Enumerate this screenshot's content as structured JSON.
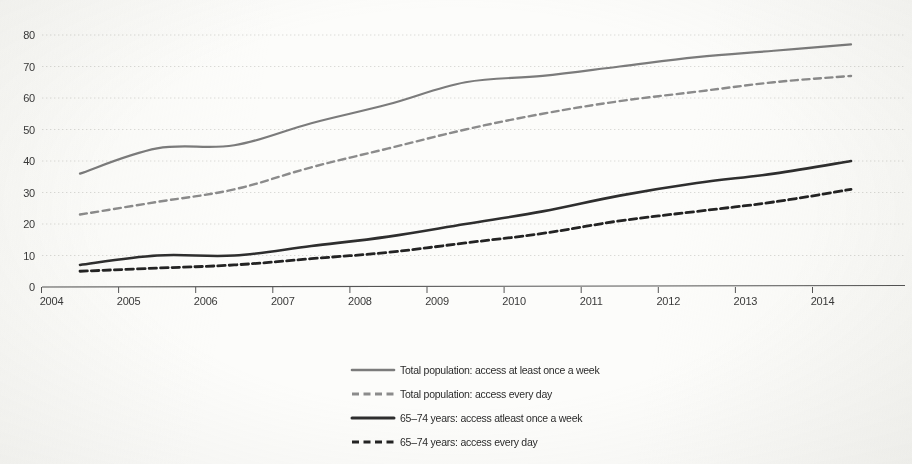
{
  "chart_data": {
    "type": "line",
    "title": "",
    "subtitle": "",
    "xlabel": "",
    "ylabel": "",
    "categories": [
      "2004",
      "2005",
      "2006",
      "2007",
      "2008",
      "2009",
      "2010",
      "2011",
      "2012",
      "2013",
      "2014"
    ],
    "x": [
      2004,
      2005,
      2006,
      2007,
      2008,
      2009,
      2010,
      2011,
      2012,
      2013,
      2014
    ],
    "ylim": [
      0,
      80
    ],
    "xlim": [
      2004,
      2014
    ],
    "ytick_labels": [
      "0",
      "10",
      "20",
      "30",
      "40",
      "50",
      "60",
      "70",
      "80"
    ],
    "ytick_values": [
      0,
      10,
      20,
      30,
      40,
      50,
      60,
      70,
      80
    ],
    "grid": true,
    "grid_axis": "y",
    "legend_position": "bottom-center",
    "series": [
      {
        "name": "Total population: access at least once a week",
        "style": "solid",
        "color": "#7b7b7b",
        "width": 2.2,
        "values": [
          36,
          44,
          45,
          52,
          58,
          65,
          67,
          70,
          73,
          75,
          77
        ]
      },
      {
        "name": "Total population: access every day",
        "style": "dashed",
        "color": "#8b8b8b",
        "width": 2.4,
        "values": [
          23,
          27,
          31,
          38,
          44,
          50,
          55,
          59,
          62,
          65,
          67
        ]
      },
      {
        "name": "65–74 years: access atleast once a week",
        "style": "solid",
        "color": "#2e2e2e",
        "width": 2.6,
        "values": [
          7,
          10,
          10,
          13,
          16,
          20,
          24,
          29,
          33,
          36,
          40
        ]
      },
      {
        "name": "65–74 years: access every day",
        "style": "dashed",
        "color": "#232323",
        "width": 2.8,
        "values": [
          5,
          6,
          7,
          9,
          11,
          14,
          17,
          21,
          24,
          27,
          31
        ]
      }
    ]
  },
  "axes": {
    "y_labels": [
      "80",
      "70",
      "60",
      "50",
      "40",
      "30",
      "20",
      "10",
      "0"
    ],
    "x_labels": [
      "2004",
      "2005",
      "2006",
      "2007",
      "2008",
      "2009",
      "2010",
      "2011",
      "2012",
      "2013",
      "2014"
    ]
  },
  "legend": {
    "entries": [
      {
        "label": "Total population: access at least once a week"
      },
      {
        "label": "Total population: access every day"
      },
      {
        "label": "65–74 years: access atleast once a week"
      },
      {
        "label": "65–74 years: access every day"
      }
    ]
  },
  "colors": {
    "background": "#fcfcfa",
    "grid": "#b8b8b4",
    "axis": "#555555",
    "series_light": "#7b7b7b",
    "series_dark": "#2b2b2b",
    "text": "#333333"
  }
}
